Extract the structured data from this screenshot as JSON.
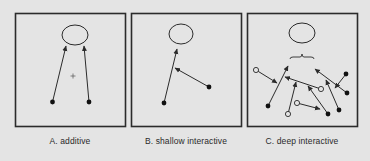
{
  "colors": {
    "background": "#e4e4e4",
    "stroke": "#2b2b2b"
  },
  "panels": [
    {
      "id": "A",
      "caption": "A. additive",
      "box": {
        "x": 15.5,
        "y": 13.5,
        "w": 110,
        "h": 113
      },
      "ellipse": {
        "cx": 75,
        "cy": 35,
        "rx": 13,
        "ry": 10
      },
      "plus": {
        "x": 73,
        "y": 76
      },
      "filled_dots": [
        [
          52.5,
          102
        ],
        [
          89,
          102
        ]
      ],
      "open_dots": [],
      "arrows": [
        {
          "from": [
            52.5,
            102
          ],
          "to": [
            66,
            46
          ]
        },
        {
          "from": [
            89,
            102
          ],
          "to": [
            84,
            46
          ]
        }
      ]
    },
    {
      "id": "B",
      "caption": "B. shallow interactive",
      "box": {
        "x": 131.5,
        "y": 13.5,
        "w": 110,
        "h": 113
      },
      "ellipse": {
        "cx": 181,
        "cy": 34,
        "rx": 12,
        "ry": 10
      },
      "filled_dots": [
        [
          164,
          103
        ],
        [
          209,
          87
        ]
      ],
      "open_dots": [],
      "arrows": [
        {
          "from": [
            164,
            103
          ],
          "to": [
            177,
            49
          ]
        },
        {
          "from": [
            209,
            87
          ],
          "to": [
            175,
            68
          ]
        }
      ]
    },
    {
      "id": "C",
      "caption": "C. deep interactive",
      "box": {
        "x": 247.5,
        "y": 13.5,
        "w": 110,
        "h": 113
      },
      "ellipse": {
        "cx": 302,
        "cy": 33,
        "rx": 13,
        "ry": 10
      },
      "brace": {
        "x1": 290,
        "x2": 314,
        "y": 57
      },
      "filled_dots": [
        [
          268,
          106
        ],
        [
          328,
          114
        ],
        [
          339,
          110
        ],
        [
          347,
          93
        ],
        [
          346,
          74
        ]
      ],
      "open_dots": [
        [
          256,
          70
        ],
        [
          321,
          89
        ],
        [
          288,
          114
        ],
        [
          297,
          103
        ]
      ],
      "arrows": [
        {
          "from": [
            256,
            70
          ],
          "to": [
            277,
            83
          ]
        },
        {
          "from": [
            268,
            106
          ],
          "to": [
            288,
            66
          ]
        },
        {
          "from": [
            321,
            89
          ],
          "to": [
            285,
            77
          ]
        },
        {
          "from": [
            288,
            114
          ],
          "to": [
            296,
            82
          ]
        },
        {
          "from": [
            297,
            103
          ],
          "to": [
            320,
            109
          ]
        },
        {
          "from": [
            328,
            114
          ],
          "to": [
            308,
            86
          ]
        },
        {
          "from": [
            339,
            110
          ],
          "to": [
            326,
            80
          ]
        },
        {
          "from": [
            347,
            93
          ],
          "to": [
            315,
            69
          ]
        },
        {
          "from": [
            346,
            74
          ],
          "to": [
            335,
            88
          ]
        }
      ]
    }
  ]
}
